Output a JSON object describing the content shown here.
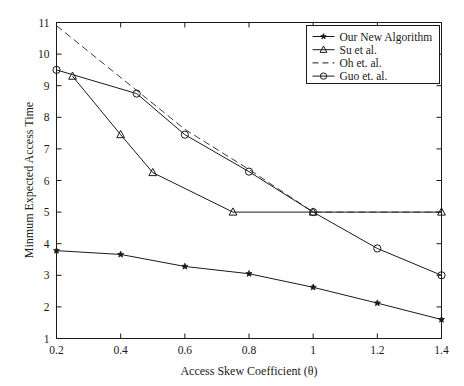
{
  "chart_data": {
    "type": "line",
    "title": "",
    "xlabel": "Access Skew Coefficient (θ)",
    "ylabel": "Minmum Expected Access Time",
    "xlim": [
      0.2,
      1.4
    ],
    "ylim": [
      1,
      11
    ],
    "xticks": [
      0.2,
      0.4,
      0.6,
      0.8,
      1.0,
      1.2,
      1.4
    ],
    "xticklabels": [
      "0.2",
      "0.4",
      "0.6",
      "0.8",
      "1",
      "1.2",
      "1.4"
    ],
    "yticks": [
      1,
      2,
      3,
      4,
      5,
      6,
      7,
      8,
      9,
      10,
      11
    ],
    "yticklabels": [
      "1",
      "2",
      "3",
      "4",
      "5",
      "6",
      "7",
      "8",
      "9",
      "10",
      "11"
    ],
    "grid": false,
    "legend_position": "top-right",
    "series": [
      {
        "name": "Our New Algorithm",
        "marker": "filled-star",
        "linestyle": "solid",
        "color": "#1a1a1a",
        "x": [
          0.2,
          0.4,
          0.6,
          0.8,
          1.0,
          1.2,
          1.4
        ],
        "y": [
          3.78,
          3.66,
          3.28,
          3.05,
          2.62,
          2.12,
          1.6
        ]
      },
      {
        "name": "Su et al.",
        "marker": "open-triangle",
        "linestyle": "solid",
        "color": "#1a1a1a",
        "x": [
          0.25,
          0.4,
          0.5,
          0.75,
          1.0,
          1.4
        ],
        "y": [
          9.3,
          7.45,
          6.25,
          5.0,
          5.0,
          5.0
        ]
      },
      {
        "name": "Oh et. al.",
        "marker": "none",
        "linestyle": "dashed",
        "color": "#3a3a3a",
        "x": [
          0.2,
          0.6,
          0.8,
          1.0,
          1.4
        ],
        "y": [
          10.9,
          7.62,
          6.35,
          5.0,
          5.0
        ]
      },
      {
        "name": "Guo et. al.",
        "marker": "open-circle",
        "linestyle": "solid",
        "color": "#1a1a1a",
        "x": [
          0.2,
          0.45,
          0.6,
          0.8,
          1.0,
          1.2,
          1.4
        ],
        "y": [
          9.5,
          8.75,
          7.45,
          6.28,
          5.0,
          3.85,
          3.0
        ]
      }
    ]
  },
  "legend": {
    "items": [
      {
        "label": "Our New Algorithm",
        "marker": "filled-star",
        "linestyle": "solid"
      },
      {
        "label": "Su et al.",
        "marker": "open-triangle",
        "linestyle": "solid"
      },
      {
        "label": "Oh et. al.",
        "marker": "none",
        "linestyle": "dashed"
      },
      {
        "label": "Guo et. al.",
        "marker": "open-circle",
        "linestyle": "solid"
      }
    ]
  },
  "axes": {
    "x_title": "Access Skew Coefficient (θ)",
    "y_title": "Minmum Expected Access Time"
  }
}
